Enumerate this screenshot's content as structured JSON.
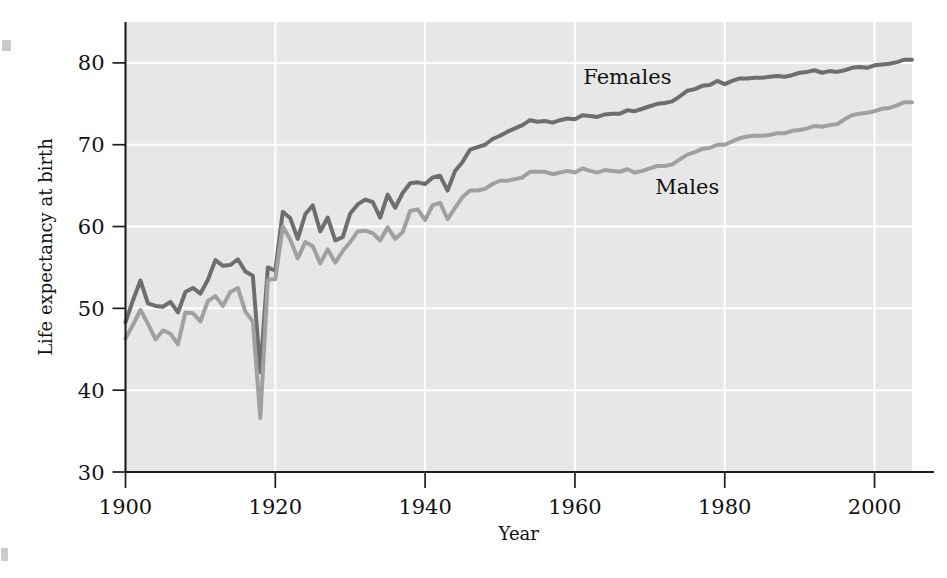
{
  "figure": {
    "background_color": "#ffffff",
    "plot_background_color": "#e7e7e7",
    "gridline_color": "#ffffff",
    "axis_color": "#1d1d1d"
  },
  "chart_data": {
    "type": "line",
    "title": "",
    "subtitle": "",
    "xlabel": "Year",
    "ylabel": "Life expectancy at birth",
    "xlim": [
      1900,
      2005
    ],
    "ylim": [
      30,
      85
    ],
    "xticks": [
      1900,
      1920,
      1940,
      1960,
      1980,
      2000
    ],
    "xtick_labels": [
      "1900",
      "1920",
      "1940",
      "1960",
      "1980",
      "2000"
    ],
    "yticks": [
      30,
      40,
      50,
      60,
      70,
      80
    ],
    "ytick_labels": [
      "30",
      "40",
      "50",
      "60",
      "70",
      "80"
    ],
    "grid": "both",
    "legend_position": "inline-annotations",
    "annotations": [
      {
        "text": "Females",
        "x": 1967,
        "y": 77.4
      },
      {
        "text": "Males",
        "x": 1975,
        "y": 64.0
      }
    ],
    "series": [
      {
        "name": "Females",
        "label": "Females",
        "color": "#6e6e6e",
        "x": [
          1900,
          1901,
          1902,
          1903,
          1904,
          1905,
          1906,
          1907,
          1908,
          1909,
          1910,
          1911,
          1912,
          1913,
          1914,
          1915,
          1916,
          1917,
          1918,
          1919,
          1920,
          1921,
          1922,
          1923,
          1924,
          1925,
          1926,
          1927,
          1928,
          1929,
          1930,
          1931,
          1932,
          1933,
          1934,
          1935,
          1936,
          1937,
          1938,
          1939,
          1940,
          1941,
          1942,
          1943,
          1944,
          1945,
          1946,
          1947,
          1948,
          1949,
          1950,
          1951,
          1952,
          1953,
          1954,
          1955,
          1956,
          1957,
          1958,
          1959,
          1960,
          1961,
          1962,
          1963,
          1964,
          1965,
          1966,
          1967,
          1968,
          1969,
          1970,
          1971,
          1972,
          1973,
          1974,
          1975,
          1976,
          1977,
          1978,
          1979,
          1980,
          1981,
          1982,
          1983,
          1984,
          1985,
          1986,
          1987,
          1988,
          1989,
          1990,
          1991,
          1992,
          1993,
          1994,
          1995,
          1996,
          1997,
          1998,
          1999,
          2000,
          2001,
          2002,
          2003,
          2004,
          2005
        ],
        "y": [
          48.3,
          51.0,
          53.4,
          50.6,
          50.3,
          50.2,
          50.8,
          49.5,
          52.0,
          52.5,
          51.8,
          53.5,
          55.9,
          55.2,
          55.3,
          56.0,
          54.5,
          54.0,
          42.2,
          55.0,
          54.6,
          61.8,
          61.0,
          58.5,
          61.5,
          62.6,
          59.4,
          61.1,
          58.3,
          58.7,
          61.6,
          62.7,
          63.3,
          63.0,
          61.1,
          63.9,
          62.3,
          64.1,
          65.3,
          65.4,
          65.2,
          66.0,
          66.2,
          64.4,
          66.8,
          67.9,
          69.4,
          69.7,
          70.0,
          70.7,
          71.1,
          71.6,
          72.0,
          72.4,
          73.0,
          72.8,
          72.9,
          72.7,
          73.0,
          73.2,
          73.1,
          73.6,
          73.5,
          73.4,
          73.7,
          73.8,
          73.8,
          74.2,
          74.1,
          74.4,
          74.7,
          75.0,
          75.1,
          75.3,
          75.9,
          76.6,
          76.8,
          77.2,
          77.3,
          77.8,
          77.4,
          77.8,
          78.1,
          78.1,
          78.2,
          78.2,
          78.3,
          78.4,
          78.3,
          78.5,
          78.8,
          78.9,
          79.1,
          78.8,
          79.0,
          78.9,
          79.1,
          79.4,
          79.5,
          79.4,
          79.7,
          79.8,
          79.9,
          80.1,
          80.4,
          80.4
        ]
      },
      {
        "name": "Males",
        "label": "Males",
        "color": "#a0a0a0",
        "x": [
          1900,
          1901,
          1902,
          1903,
          1904,
          1905,
          1906,
          1907,
          1908,
          1909,
          1910,
          1911,
          1912,
          1913,
          1914,
          1915,
          1916,
          1917,
          1918,
          1919,
          1920,
          1921,
          1922,
          1923,
          1924,
          1925,
          1926,
          1927,
          1928,
          1929,
          1930,
          1931,
          1932,
          1933,
          1934,
          1935,
          1936,
          1937,
          1938,
          1939,
          1940,
          1941,
          1942,
          1943,
          1944,
          1945,
          1946,
          1947,
          1948,
          1949,
          1950,
          1951,
          1952,
          1953,
          1954,
          1955,
          1956,
          1957,
          1958,
          1959,
          1960,
          1961,
          1962,
          1963,
          1964,
          1965,
          1966,
          1967,
          1968,
          1969,
          1970,
          1971,
          1972,
          1973,
          1974,
          1975,
          1976,
          1977,
          1978,
          1979,
          1980,
          1981,
          1982,
          1983,
          1984,
          1985,
          1986,
          1987,
          1988,
          1989,
          1990,
          1991,
          1992,
          1993,
          1994,
          1995,
          1996,
          1997,
          1998,
          1999,
          2000,
          2001,
          2002,
          2003,
          2004,
          2005
        ],
        "y": [
          46.3,
          48.0,
          49.8,
          48.1,
          46.2,
          47.3,
          46.9,
          45.6,
          49.5,
          49.4,
          48.4,
          50.9,
          51.5,
          50.3,
          52.0,
          52.5,
          49.6,
          48.4,
          36.6,
          53.5,
          53.6,
          60.0,
          58.4,
          56.1,
          58.1,
          57.6,
          55.5,
          57.2,
          55.6,
          57.0,
          58.1,
          59.4,
          59.5,
          59.2,
          58.3,
          59.9,
          58.5,
          59.3,
          61.9,
          62.1,
          60.8,
          62.6,
          62.9,
          60.9,
          62.3,
          63.6,
          64.4,
          64.4,
          64.6,
          65.2,
          65.6,
          65.6,
          65.8,
          66.0,
          66.7,
          66.7,
          66.7,
          66.4,
          66.6,
          66.8,
          66.6,
          67.1,
          66.8,
          66.6,
          66.9,
          66.8,
          66.7,
          67.0,
          66.6,
          66.8,
          67.1,
          67.4,
          67.4,
          67.6,
          68.2,
          68.8,
          69.1,
          69.5,
          69.6,
          70.0,
          70.0,
          70.4,
          70.8,
          71.0,
          71.1,
          71.1,
          71.2,
          71.4,
          71.4,
          71.7,
          71.8,
          72.0,
          72.3,
          72.2,
          72.4,
          72.5,
          73.1,
          73.6,
          73.8,
          73.9,
          74.1,
          74.4,
          74.5,
          74.8,
          75.2,
          75.2
        ]
      }
    ]
  }
}
